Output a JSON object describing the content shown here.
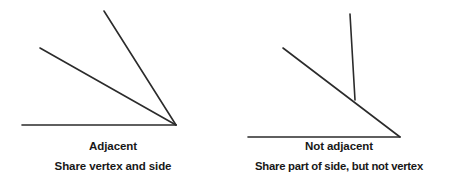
{
  "figure": {
    "background_color": "#ffffff",
    "stroke_color": "#2b2b2b",
    "text_color": "#181818",
    "width": 452,
    "height": 190
  },
  "panels": [
    {
      "id": "adjacent",
      "title": "Adjacent",
      "subtitle": "Share vertex and side",
      "geometry": {
        "type": "angle-pair",
        "description": "Two angles sharing a common vertex and a common side",
        "vertex": [
          176,
          125
        ],
        "rays": [
          {
            "name": "horizontal-baseline-ray",
            "from": [
              176,
              125
            ],
            "to": [
              22,
              125
            ]
          },
          {
            "name": "middle-ray",
            "from": [
              176,
              125
            ],
            "to": [
              40,
              48
            ]
          },
          {
            "name": "steep-ray",
            "from": [
              176,
              125
            ],
            "to": [
              104,
              11
            ]
          }
        ]
      }
    },
    {
      "id": "not-adjacent",
      "title": "Not adjacent",
      "subtitle": "Share part of side, but not vertex",
      "geometry": {
        "type": "angle-pair",
        "description": "Two angles that share part of a side but have different vertices",
        "vertex": [
          174,
          137
        ],
        "junction": [
          129,
          100
        ],
        "rays": [
          {
            "name": "horizontal-baseline-ray",
            "from": [
              174,
              137
            ],
            "to": [
              22,
              137
            ]
          },
          {
            "name": "slanted-ray",
            "from": [
              174,
              137
            ],
            "to": [
              57,
              48
            ]
          },
          {
            "name": "vertical-ray",
            "from": [
              129,
              100
            ],
            "to": [
              124,
              14
            ]
          }
        ]
      }
    }
  ]
}
